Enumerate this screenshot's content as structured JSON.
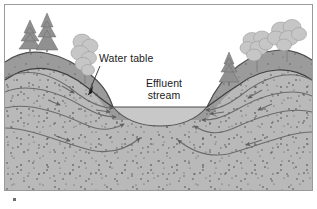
{
  "figure": {
    "kind": "geology-cross-section",
    "title_text": null,
    "width": 317,
    "height": 209
  },
  "labels": {
    "water_table": "Water table",
    "effluent_line1": "Effluent",
    "effluent_line2": "stream"
  },
  "colors": {
    "background": "#ffffff",
    "frame_border": "#9a9a9a",
    "aquifer_fill": "#b9b9b9",
    "topsoil_fill": "#a2a2a2",
    "stipple_dot": "#3a3a3a",
    "flowline": "#6a6a6a",
    "water_table_line": "#4a4a4a",
    "stream_water": "#c9c9c9",
    "ground_outline": "#555555",
    "conifer": "#8e8e8e",
    "broadleaf": "#c2c2c2",
    "text": "#1a1a1a",
    "leader_line": "#2b2b2b"
  },
  "scene": {
    "frame": {
      "x": 4,
      "y": 4,
      "width": 309,
      "height": 187
    },
    "ground_surface_note": "Two hills flanking a central valley containing the stream",
    "stream": {
      "water_surface_y": 107,
      "left_bank_x": 113,
      "right_bank_x": 207,
      "channel_bottom_y": 124,
      "type": "effluent (gaining) stream"
    },
    "water_table": {
      "description": "Water table intersects the land surface at the stream banks and rises beneath the hills",
      "left_crest_y": 65,
      "right_crest_y": 66,
      "stream_intersection_y": 107
    },
    "topsoil_band": {
      "description": "Darker weathered soil band between the ground surface and the water table"
    },
    "flow_lines": {
      "count_left": 4,
      "count_right": 4,
      "direction": "converging toward the stream from both sides",
      "arrow_count": 13
    },
    "vegetation": {
      "left_hill": [
        {
          "type": "conifer",
          "x": 30,
          "base_y": 52,
          "height": 30
        },
        {
          "type": "conifer",
          "x": 46,
          "base_y": 52,
          "height": 38
        },
        {
          "type": "broadleaf",
          "x": 85,
          "base_y": 82,
          "height": 44
        }
      ],
      "right_hill": [
        {
          "type": "conifer",
          "x": 229,
          "base_y": 84,
          "height": 34
        },
        {
          "type": "broadleaf",
          "x": 256,
          "base_y": 70,
          "height": 38
        },
        {
          "type": "broadleaf",
          "x": 286,
          "base_y": 60,
          "height": 42
        }
      ]
    },
    "leader": {
      "from_label": "Water table",
      "path": "from text baseline left edge down-left to the water table surface on the left bank",
      "tip_x": 87,
      "tip_y": 95
    }
  }
}
